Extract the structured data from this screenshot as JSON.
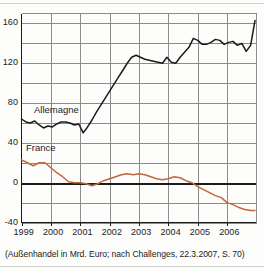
{
  "figure": {
    "caption": "(Außenhandel in Mrd. Euro; nach Challenges, 22.3.2007, S. 70)"
  },
  "chart_data": {
    "type": "line",
    "title": "",
    "xlabel": "",
    "ylabel": "",
    "unit": "Mrd. Euro",
    "xlim": [
      1999.0,
      2007.0
    ],
    "ylim": [
      -40,
      170
    ],
    "yticks": [
      -40,
      0,
      40,
      80,
      120,
      160
    ],
    "ytick_labels": [
      "-40",
      "0",
      "40",
      "80",
      "120",
      "160"
    ],
    "minor_ytick_step": 20,
    "xticks": [
      1999,
      2000,
      2001,
      2002,
      2003,
      2004,
      2005,
      2006
    ],
    "xtick_labels": [
      "1999",
      "2000",
      "2001",
      "2002",
      "2003",
      "2004",
      "2005",
      "2006"
    ],
    "grid": true,
    "zero_line": 0,
    "legend_position": "inline-annotations",
    "colors": {
      "allemagne": "#1b1b1b",
      "france": "#c2673c",
      "grid": "#8c8c8c",
      "axis": "#1b1b1b",
      "zero_line": "#1b1b1b"
    },
    "series": [
      {
        "name": "Allemagne",
        "label": "Allemagne",
        "color": "#1b1b1b",
        "x": [
          1999.0,
          1999.15,
          1999.3,
          1999.45,
          1999.6,
          1999.75,
          1999.9,
          2000.05,
          2000.2,
          2000.35,
          2000.5,
          2000.65,
          2000.8,
          2000.95,
          2001.1,
          2001.25,
          2001.4,
          2001.55,
          2001.7,
          2001.85,
          2002.0,
          2002.15,
          2002.3,
          2002.45,
          2002.6,
          2002.75,
          2002.9,
          2003.05,
          2003.2,
          2003.35,
          2003.5,
          2003.65,
          2003.8,
          2003.95,
          2004.1,
          2004.25,
          2004.4,
          2004.55,
          2004.7,
          2004.85,
          2005.0,
          2005.15,
          2005.3,
          2005.45,
          2005.6,
          2005.75,
          2005.9,
          2006.05,
          2006.2,
          2006.35,
          2006.5,
          2006.65,
          2006.8,
          2006.95
        ],
        "y": [
          64,
          61,
          60,
          62,
          58,
          55,
          57,
          56,
          59,
          61,
          61,
          60,
          58,
          59,
          50,
          56,
          63,
          71,
          78,
          85,
          92,
          99,
          106,
          113,
          120,
          126,
          128,
          126,
          124,
          123,
          122,
          121,
          120,
          126,
          121,
          120,
          126,
          131,
          136,
          145,
          143,
          139,
          139,
          141,
          144,
          143,
          139,
          141,
          142,
          138,
          140,
          132,
          138,
          163
        ]
      },
      {
        "name": "France",
        "label": "France",
        "color": "#c2673c",
        "x": [
          1999.0,
          1999.2,
          1999.4,
          1999.6,
          1999.8,
          2000.0,
          2000.2,
          2000.4,
          2000.6,
          2000.8,
          2001.0,
          2001.2,
          2001.4,
          2001.6,
          2001.8,
          2002.0,
          2002.2,
          2002.4,
          2002.6,
          2002.8,
          2003.0,
          2003.2,
          2003.4,
          2003.6,
          2003.8,
          2004.0,
          2004.2,
          2004.4,
          2004.6,
          2004.8,
          2005.0,
          2005.2,
          2005.4,
          2005.6,
          2005.8,
          2006.0,
          2006.2,
          2006.4,
          2006.6,
          2006.8,
          2006.95
        ],
        "y": [
          23,
          20,
          17,
          20,
          20,
          15,
          10,
          6,
          1,
          0,
          0,
          -1,
          -3,
          -1,
          2,
          4,
          6,
          8,
          9,
          8,
          9,
          8,
          6,
          4,
          3,
          4,
          6,
          5,
          2,
          0,
          -4,
          -7,
          -10,
          -13,
          -15,
          -20,
          -22,
          -25,
          -27,
          -28,
          -28
        ]
      }
    ]
  },
  "annotations": [
    {
      "name": "allemagne-label",
      "text": "Allemagne"
    },
    {
      "name": "france-label",
      "text": "France"
    }
  ]
}
